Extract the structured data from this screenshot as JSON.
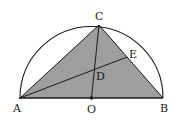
{
  "diagram": {
    "type": "geometry",
    "colors": {
      "fill": "#9e9e9e",
      "stroke": "#1a1a1a",
      "background": "#ffffff"
    },
    "points": {
      "A": {
        "label": "A",
        "x": 20,
        "y": 98
      },
      "B": {
        "label": "B",
        "x": 163,
        "y": 98
      },
      "O": {
        "label": "O",
        "x": 91.5,
        "y": 98
      },
      "C": {
        "label": "C",
        "x": 99,
        "y": 25
      },
      "D": {
        "label": "D",
        "x": 95,
        "y": 69
      },
      "E": {
        "label": "E",
        "x": 127,
        "y": 57
      }
    },
    "semicircle": {
      "center": "O",
      "radius": 71.5
    },
    "segments": [
      "AB",
      "AC",
      "BC",
      "CO",
      "AE"
    ],
    "shaded_region": "triangle ABC"
  }
}
